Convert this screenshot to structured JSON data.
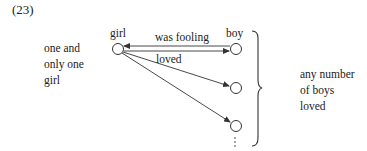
{
  "example_number": "(23)",
  "left_label": {
    "lines": [
      "one and",
      "only one",
      "girl"
    ]
  },
  "right_label": {
    "lines": [
      "any number",
      "of boys",
      "loved"
    ]
  },
  "nodes": {
    "girl": "girl",
    "boy": "boy"
  },
  "edges": {
    "top": "was fooling",
    "bottom": "loved"
  }
}
